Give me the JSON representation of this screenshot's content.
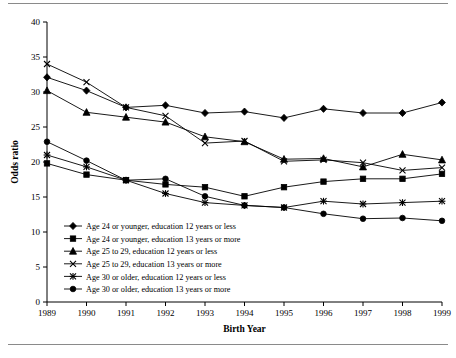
{
  "figure": {
    "has_top_rule": true,
    "has_bottom_rule": true,
    "background_color": "#ffffff",
    "line_color": "#000000"
  },
  "chart_data": {
    "type": "line",
    "title": "",
    "xlabel": "Birth Year",
    "ylabel": "Odds ratio",
    "categories": [
      "1989",
      "1990",
      "1991",
      "1992",
      "1993",
      "1994",
      "1995",
      "1996",
      "1997",
      "1998",
      "1999"
    ],
    "x": [
      1989,
      1990,
      1991,
      1992,
      1993,
      1994,
      1995,
      1996,
      1997,
      1998,
      1999
    ],
    "xlim": [
      1989,
      1999
    ],
    "ylim": [
      0,
      40
    ],
    "yticks": [
      0,
      5,
      10,
      15,
      20,
      25,
      30,
      35,
      40
    ],
    "xticks": [
      "1989",
      "1990",
      "1991",
      "1992",
      "1993",
      "1994",
      "1995",
      "1996",
      "1997",
      "1998",
      "1999"
    ],
    "grid": false,
    "legend_position": "inside-lower-left",
    "series": [
      {
        "name": "Age 24 or younger, education 12 years or less",
        "marker": "diamond",
        "values": [
          32.1,
          30.2,
          27.8,
          28.1,
          27.0,
          27.2,
          26.3,
          27.6,
          27.0,
          27.0,
          28.5
        ]
      },
      {
        "name": "Age 24 or younger, education 13 years or more",
        "marker": "square",
        "values": [
          19.8,
          18.2,
          17.4,
          16.8,
          16.4,
          15.1,
          16.4,
          17.2,
          17.6,
          17.6,
          18.3
        ]
      },
      {
        "name": "Age 25 to 29, education 12 years or less",
        "marker": "triangle",
        "values": [
          30.2,
          27.1,
          26.4,
          25.7,
          23.6,
          22.9,
          20.4,
          20.5,
          19.3,
          21.1,
          20.3
        ]
      },
      {
        "name": "Age 25 to 29, education 13 years or more",
        "marker": "x",
        "values": [
          34.0,
          31.4,
          27.8,
          26.6,
          22.7,
          23.0,
          20.1,
          20.3,
          19.9,
          18.8,
          19.2
        ]
      },
      {
        "name": "Age 30 or older, education 12 years or less",
        "marker": "star",
        "values": [
          21.0,
          19.3,
          17.4,
          15.5,
          14.2,
          13.8,
          13.5,
          14.4,
          14.0,
          14.2,
          14.4
        ]
      },
      {
        "name": "Age 30 or older, education 13 years or more",
        "marker": "circle",
        "values": [
          22.9,
          20.2,
          17.4,
          17.6,
          15.1,
          13.8,
          13.5,
          12.6,
          11.9,
          12.0,
          11.6
        ]
      }
    ]
  },
  "legend": {
    "items": [
      {
        "label": "Age 24 or younger, education 12 years or less",
        "marker": "diamond"
      },
      {
        "label": "Age 24 or younger, education 13 years or more",
        "marker": "square"
      },
      {
        "label": "Age 25 to 29, education 12 years or less",
        "marker": "triangle"
      },
      {
        "label": "Age 25 to 29, education 13 years or more",
        "marker": "x"
      },
      {
        "label": "Age 30 or older, education 12 years or less",
        "marker": "star"
      },
      {
        "label": "Age 30 or older, education 13 years or more",
        "marker": "circle"
      }
    ]
  }
}
